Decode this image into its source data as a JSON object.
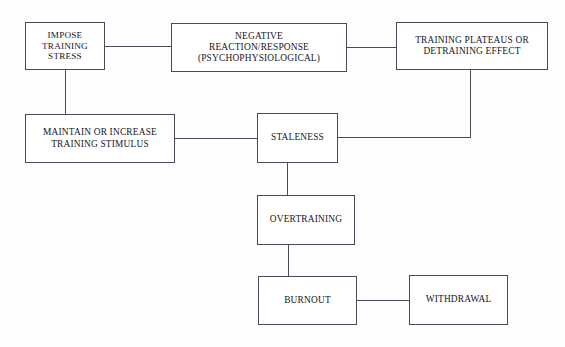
{
  "diagram": {
    "background_color": "#fdfdfd",
    "line_color": "#4a4a5a",
    "text_color": "#16161e",
    "nodes": [
      {
        "id": "impose-training-stress",
        "lines": [
          "IMPOSE",
          "TRAINING",
          "STRESS"
        ]
      },
      {
        "id": "negative-reaction",
        "lines": [
          "NEGATIVE",
          "REACTION/RESPONSE",
          "(PSYCHOPHYSIOLOGICAL)"
        ]
      },
      {
        "id": "training-plateaus",
        "lines": [
          "TRAINING PLATEAUS OR",
          "DETRAINING EFFECT"
        ]
      },
      {
        "id": "maintain-increase",
        "lines": [
          "MAINTAIN OR INCREASE",
          "TRAINING STIMULUS"
        ]
      },
      {
        "id": "staleness",
        "lines": [
          "STALENESS"
        ]
      },
      {
        "id": "overtraining",
        "lines": [
          "OVERTRAINING"
        ]
      },
      {
        "id": "burnout",
        "lines": [
          "BURNOUT"
        ]
      },
      {
        "id": "withdrawal",
        "lines": [
          "WITHDRAWAL"
        ]
      }
    ],
    "edges": [
      {
        "id": "impose-to-negative",
        "from": "impose-training-stress",
        "to": "negative-reaction",
        "style": "straight-horizontal"
      },
      {
        "id": "negative-to-plateaus",
        "from": "negative-reaction",
        "to": "training-plateaus",
        "style": "straight-horizontal"
      },
      {
        "id": "impose-to-maintain",
        "from": "impose-training-stress",
        "to": "maintain-increase",
        "style": "straight-vertical"
      },
      {
        "id": "maintain-to-staleness",
        "from": "maintain-increase",
        "to": "staleness",
        "style": "straight-horizontal"
      },
      {
        "id": "plateaus-to-staleness",
        "from": "training-plateaus",
        "to": "staleness",
        "style": "elbow-down-left"
      },
      {
        "id": "staleness-to-overtraining",
        "from": "staleness",
        "to": "overtraining",
        "style": "straight-vertical"
      },
      {
        "id": "overtraining-to-burnout",
        "from": "overtraining",
        "to": "burnout",
        "style": "straight-vertical"
      },
      {
        "id": "burnout-to-withdrawal",
        "from": "burnout",
        "to": "withdrawal",
        "style": "straight-horizontal"
      }
    ]
  }
}
